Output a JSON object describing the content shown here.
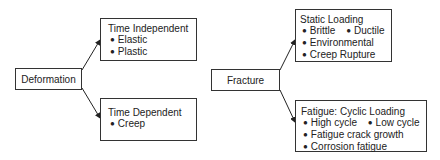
{
  "deformation": {
    "label": "Deformation",
    "children": [
      {
        "title": "Time Independent",
        "rows": [
          [
            "Elastic"
          ],
          [
            "Plastic"
          ]
        ]
      },
      {
        "title": "Time Dependent",
        "rows": [
          [
            "Creep"
          ]
        ]
      }
    ]
  },
  "fracture": {
    "label": "Fracture",
    "children": [
      {
        "title": "Static Loading",
        "rows": [
          [
            "Brittle",
            "Ductile"
          ],
          [
            "Environmental"
          ],
          [
            "Creep Rupture"
          ]
        ]
      },
      {
        "title": "Fatigue: Cyclic Loading",
        "rows": [
          [
            "High cycle",
            "Low cycle"
          ],
          [
            "Fatigue crack growth"
          ],
          [
            "Corrosion fatigue"
          ]
        ]
      }
    ]
  }
}
